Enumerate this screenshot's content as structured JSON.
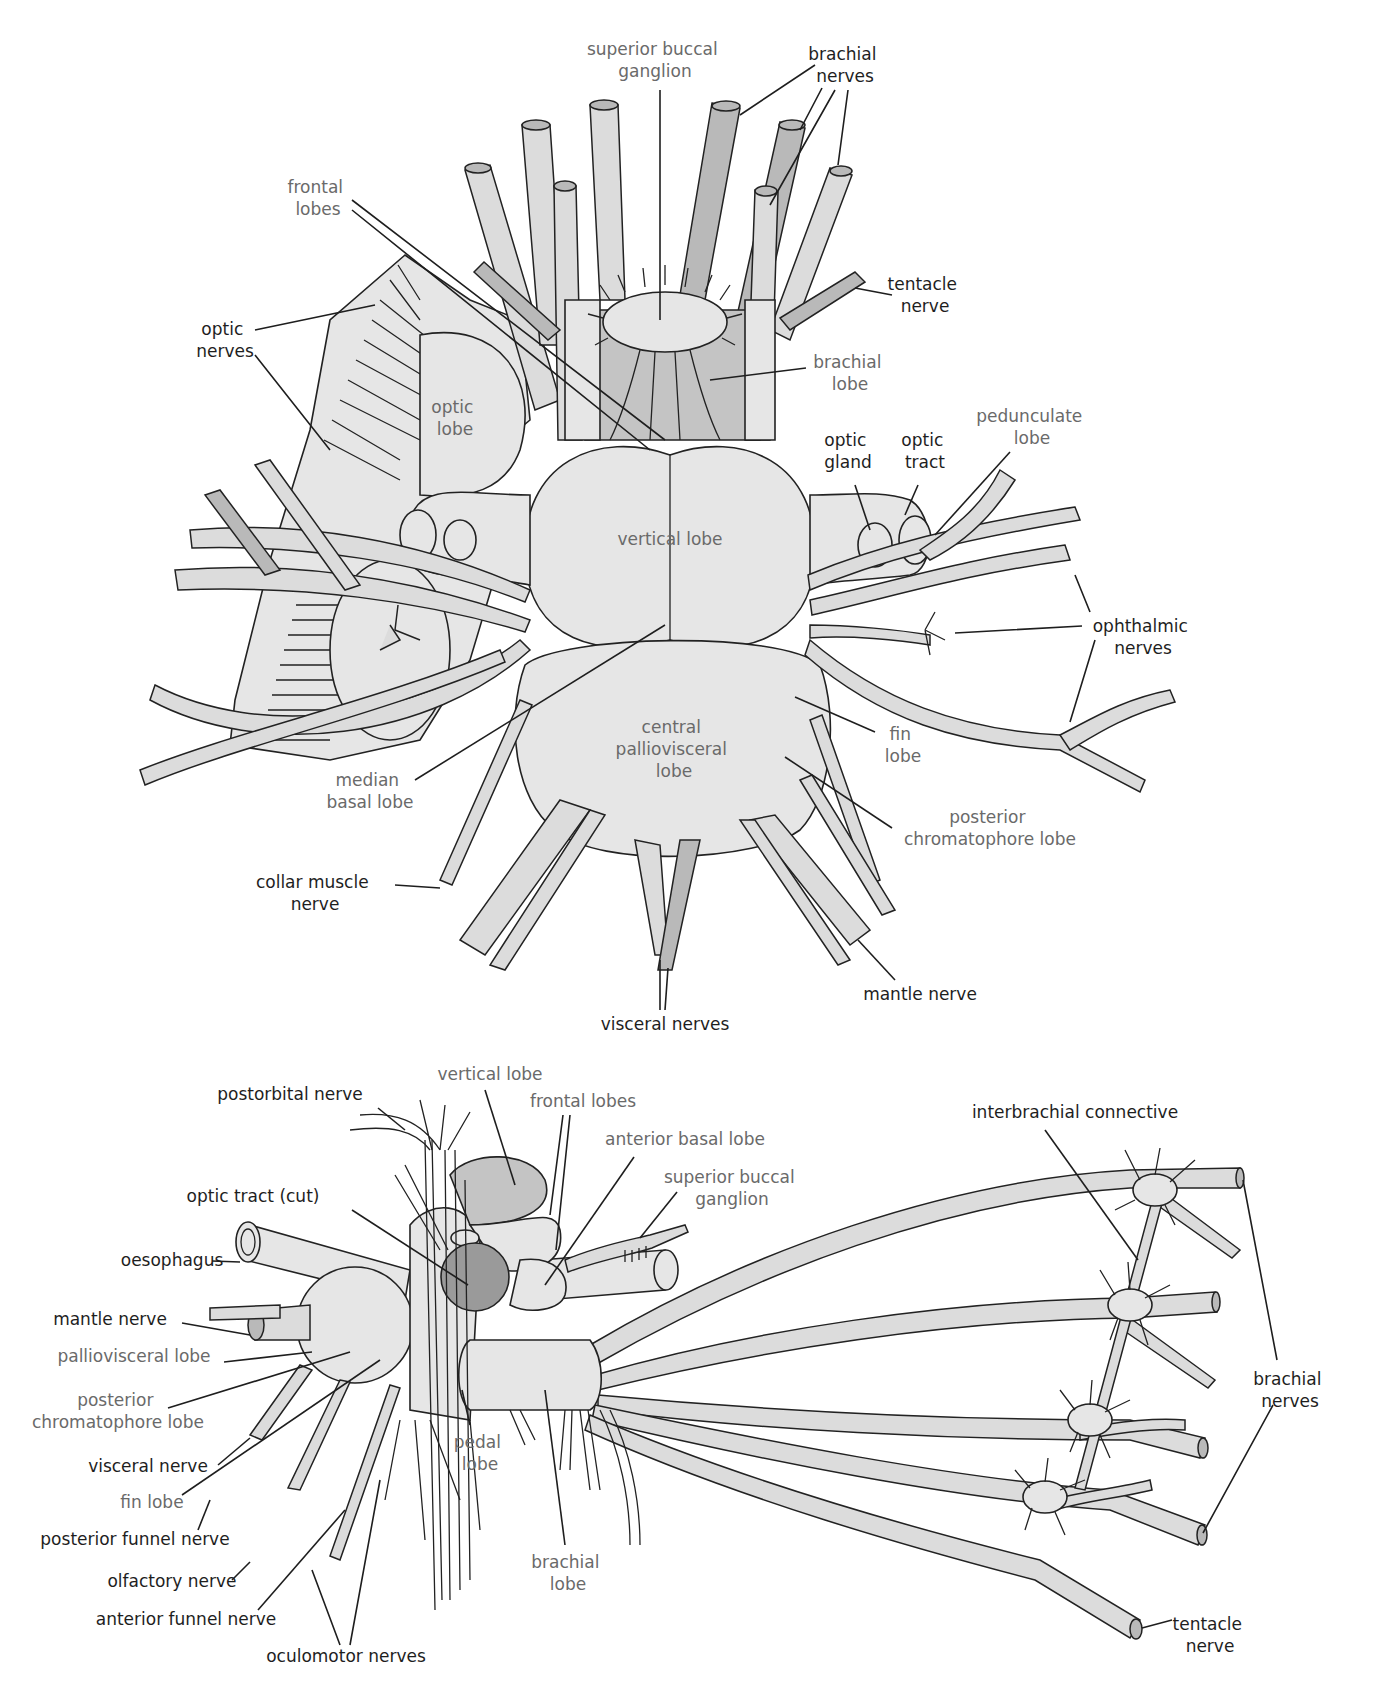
{
  "top_diagram": {
    "labels": {
      "superior_buccal_ganglion": [
        "superior buccal",
        "ganglion"
      ],
      "brachial_nerves": [
        "brachial",
        "nerves"
      ],
      "frontal_lobes": [
        "frontal",
        "lobes"
      ],
      "tentacle_nerve": [
        "tentacle",
        "nerve"
      ],
      "optic_nerves": [
        "optic",
        "nerves"
      ],
      "brachial_lobe": [
        "brachial",
        "lobe"
      ],
      "optic_lobe": [
        "optic",
        "lobe"
      ],
      "pedunculate_lobe": [
        "pedunculate",
        "lobe"
      ],
      "optic_gland": [
        "optic",
        "gland"
      ],
      "optic_tract": [
        "optic",
        "tract"
      ],
      "vertical_lobe": "vertical lobe",
      "ophthalmic_nerves": [
        "ophthalmic",
        "nerves"
      ],
      "central_palliovisceral_lobe": [
        "central",
        "palliovisceral",
        "lobe"
      ],
      "fin_lobe": [
        "fin",
        "lobe"
      ],
      "median_basal_lobe": [
        "median",
        "basal lobe"
      ],
      "posterior_chromatophore_lobe": [
        "posterior",
        "chromatophore lobe"
      ],
      "collar_muscle_nerve": [
        "collar muscle",
        "nerve"
      ],
      "mantle_nerve": "mantle nerve",
      "visceral_nerves": "visceral nerves"
    }
  },
  "bottom_diagram": {
    "labels": {
      "postorbital_nerve": "postorbital nerve",
      "vertical_lobe": "vertical lobe",
      "frontal_lobes": "frontal lobes",
      "anterior_basal_lobe": "anterior basal lobe",
      "superior_buccal_ganglion": [
        "superior buccal",
        "ganglion"
      ],
      "optic_tract_cut": "optic tract (cut)",
      "oesophagus": "oesophagus",
      "mantle_nerve": "mantle nerve",
      "palliovisceral_lobe": "palliovisceral lobe",
      "posterior_chromatophore_lobe": [
        "posterior",
        "chromatophore lobe"
      ],
      "visceral_nerve": "visceral nerve",
      "fin_lobe": "fin lobe",
      "posterior_funnel_nerve": "posterior funnel nerve",
      "olfactory_nerve": "olfactory nerve",
      "anterior_funnel_nerve": "anterior funnel nerve",
      "oculomotor_nerves": "oculomotor nerves",
      "pedal_lobe": [
        "pedal",
        "lobe"
      ],
      "brachial_lobe": [
        "brachial",
        "lobe"
      ],
      "interbrachial_connective": "interbrachial connective",
      "brachial_nerves": [
        "brachial",
        "nerves"
      ],
      "tentacle_nerve": [
        "tentacle",
        "nerve"
      ]
    }
  },
  "colors": {
    "structure_label": "#1e1e1e",
    "lobe_label": "#6a6a6a",
    "nerve_fill": "#dcdcdc",
    "lobe_fill": "#e6e6e6",
    "dark_lobe_fill": "#9a9a9a"
  }
}
